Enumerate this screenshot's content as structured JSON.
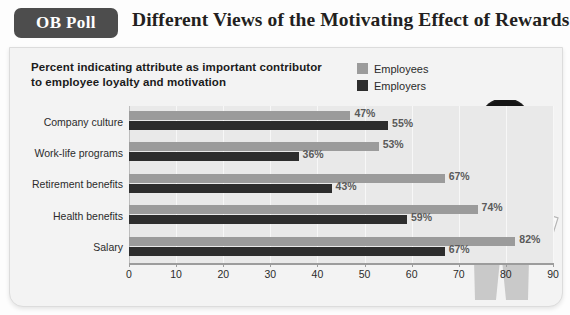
{
  "header": {
    "badge": "OB Poll",
    "title": "Different Views of  the Motivating Effect of Rewards"
  },
  "card": {
    "subtitle": "Percent indicating attribute as important contributor\nto employee loyalty and motivation"
  },
  "legend": {
    "position": "top-right",
    "items": [
      {
        "label": "Employees",
        "color": "#9b9b9b"
      },
      {
        "label": "Employers",
        "color": "#2d2d2d"
      }
    ]
  },
  "illustration": {
    "name": "man-with-megaphone",
    "parts": [
      "megaphone-icon",
      "head",
      "shirt",
      "necktie",
      "belt",
      "trousers",
      "clipboard"
    ]
  },
  "chart_data": {
    "type": "bar",
    "orientation": "horizontal",
    "title": "Different Views of  the Motivating Effect of Rewards",
    "subtitle": "Percent indicating attribute as important contributor to employee loyalty and motivation",
    "categories": [
      "Company culture",
      "Work-life programs",
      "Retirement benefits",
      "Health benefits",
      "Salary"
    ],
    "series": [
      {
        "name": "Employees",
        "color": "#9b9b9b",
        "values": [
          47,
          53,
          67,
          74,
          82
        ],
        "labels": [
          "47%",
          "53%",
          "67%",
          "74%",
          "82%"
        ]
      },
      {
        "name": "Employers",
        "color": "#2d2d2d",
        "values": [
          55,
          36,
          43,
          59,
          67
        ],
        "labels": [
          "55%",
          "36%",
          "43%",
          "59%",
          "67%"
        ]
      }
    ],
    "xlabel": "",
    "ylabel": "",
    "xlim": [
      0,
      90
    ],
    "xticks": [
      0,
      10,
      20,
      30,
      40,
      50,
      60,
      70,
      80,
      90
    ],
    "xtick_labels": [
      "0",
      "10",
      "20",
      "30",
      "40",
      "50",
      "60",
      "70",
      "80",
      "90"
    ],
    "grid": true,
    "legend_position": "top-right"
  }
}
